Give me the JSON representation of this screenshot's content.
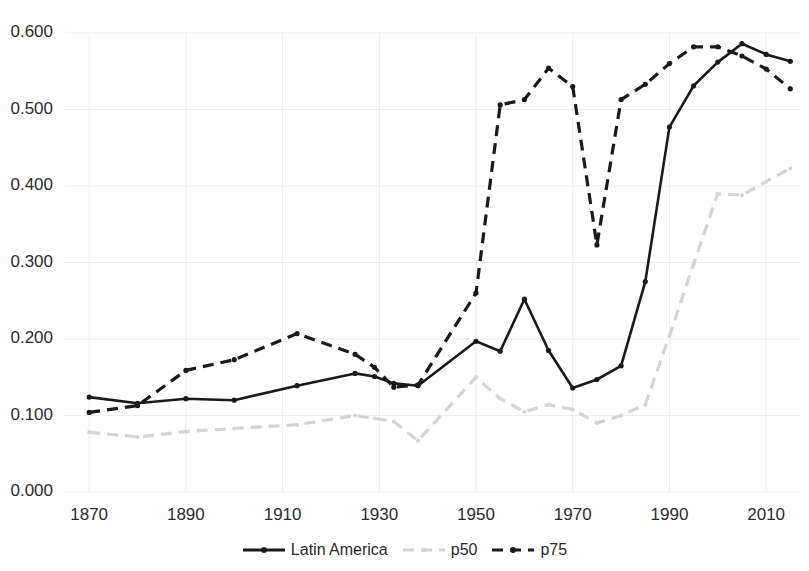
{
  "chart_data": {
    "type": "line",
    "title": "",
    "xlabel": "",
    "ylabel": "",
    "xlim": [
      1865,
      2017
    ],
    "ylim": [
      0.0,
      0.6
    ],
    "grid": true,
    "legend_position": "bottom",
    "y_ticks": [
      "0.000",
      "0.100",
      "0.200",
      "0.300",
      "0.400",
      "0.500",
      "0.600"
    ],
    "y_tick_values": [
      0.0,
      0.1,
      0.2,
      0.3,
      0.4,
      0.5,
      0.6
    ],
    "x_ticks": [
      "1870",
      "1890",
      "1910",
      "1930",
      "1950",
      "1970",
      "1990",
      "2010"
    ],
    "x_tick_values": [
      1870,
      1890,
      1910,
      1930,
      1950,
      1970,
      1990,
      2010
    ],
    "colors": {
      "latin_america": "#1a1a1a",
      "p50": "#d4d4d4",
      "p75": "#1a1a1a",
      "grid": "#ededed",
      "text": "#2b2b2b"
    },
    "series": [
      {
        "name": "Latin America",
        "style": "solid",
        "color": "#1a1a1a",
        "markers": true,
        "x": [
          1870,
          1880,
          1890,
          1900,
          1913,
          1925,
          1929,
          1933,
          1938,
          1950,
          1955,
          1960,
          1965,
          1970,
          1975,
          1980,
          1985,
          1990,
          1995,
          2000,
          2005,
          2010,
          2015
        ],
        "values": [
          0.124,
          0.116,
          0.122,
          0.12,
          0.139,
          0.155,
          0.151,
          0.142,
          0.139,
          0.197,
          0.184,
          0.252,
          0.185,
          0.136,
          0.147,
          0.165,
          0.275,
          0.477,
          0.531,
          0.562,
          0.586,
          0.572,
          0.563
        ]
      },
      {
        "name": "p50",
        "style": "dashed",
        "color": "#d4d4d4",
        "markers": true,
        "x": [
          1870,
          1880,
          1890,
          1900,
          1913,
          1925,
          1929,
          1933,
          1938,
          1950,
          1955,
          1960,
          1965,
          1970,
          1975,
          1980,
          1985,
          1990,
          1995,
          2000,
          2005,
          2010,
          2015
        ],
        "values": [
          0.078,
          0.072,
          0.079,
          0.083,
          0.088,
          0.1,
          0.096,
          0.092,
          0.067,
          0.15,
          0.122,
          0.105,
          0.114,
          0.108,
          0.09,
          0.1,
          0.114,
          0.204,
          0.298,
          0.39,
          0.388,
          0.406,
          0.423
        ]
      },
      {
        "name": "p75",
        "style": "dashed",
        "color": "#1a1a1a",
        "markers": true,
        "x": [
          1870,
          1880,
          1890,
          1900,
          1913,
          1925,
          1929,
          1933,
          1938,
          1950,
          1955,
          1960,
          1965,
          1970,
          1975,
          1980,
          1985,
          1990,
          1995,
          2000,
          2005,
          2010,
          2015
        ],
        "values": [
          0.104,
          0.113,
          0.159,
          0.173,
          0.207,
          0.18,
          0.163,
          0.137,
          0.14,
          0.26,
          0.506,
          0.513,
          0.554,
          0.53,
          0.323,
          0.513,
          0.533,
          0.56,
          0.582,
          0.582,
          0.57,
          0.553,
          0.527
        ]
      }
    ]
  },
  "legend": {
    "items": [
      {
        "label": "Latin America",
        "icon": "solid-line-marker-icon"
      },
      {
        "label": "p50",
        "icon": "dashed-line-light-icon"
      },
      {
        "label": "p75",
        "icon": "dashed-line-dark-icon"
      }
    ]
  }
}
